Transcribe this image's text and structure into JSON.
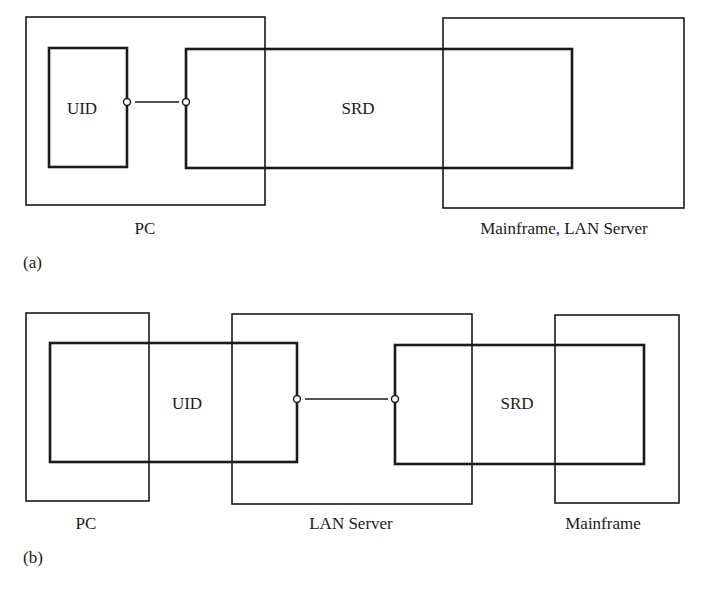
{
  "diagram_a": {
    "panel_label": "(a)",
    "nodes": {
      "pc_label": "PC",
      "server_label": "Mainframe, LAN Server"
    },
    "components": {
      "uid_label": "UID",
      "srd_label": "SRD"
    },
    "connections": [
      {
        "from": "UID",
        "to": "SRD"
      }
    ]
  },
  "diagram_b": {
    "panel_label": "(b)",
    "nodes": {
      "pc_label": "PC",
      "lan_label": "LAN Server",
      "mainframe_label": "Mainframe"
    },
    "components": {
      "uid_label": "UID",
      "srd_label": "SRD"
    },
    "connections": [
      {
        "from": "UID",
        "to": "SRD"
      }
    ]
  },
  "colors": {
    "stroke": "#1a1a1a",
    "background": "#ffffff"
  }
}
